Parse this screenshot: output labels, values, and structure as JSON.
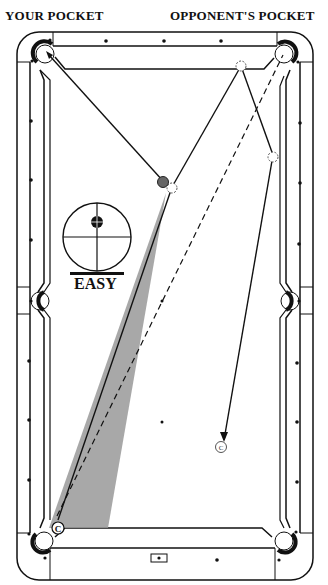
{
  "header": {
    "left_label": "YOUR POCKET",
    "right_label": "OPPONENT'S POCKET"
  },
  "difficulty": {
    "label": "EASY",
    "icon": "crosshair-target-icon"
  },
  "balls": {
    "object_ball_color": "#666666",
    "cue_ball_label": "C",
    "cue_ball_end_label": "C"
  },
  "colors": {
    "line": "#111111",
    "shaded_region": "#999999",
    "table_bg": "#ffffff"
  },
  "diagram": {
    "table": "pool-table-top-view",
    "pockets": 6,
    "diamonds_per_long_rail": 6,
    "diamonds_per_short_rail": 3
  }
}
